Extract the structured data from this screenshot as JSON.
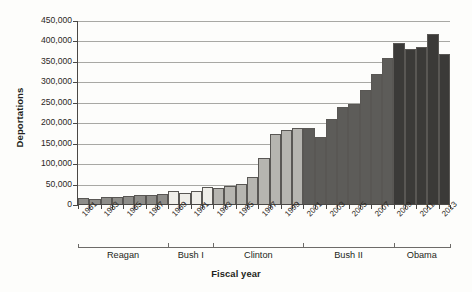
{
  "chart_data": {
    "type": "bar",
    "title": "",
    "xlabel": "Fiscal year",
    "ylabel": "Deportations",
    "ylim": [
      0,
      450000
    ],
    "ytick_labels": [
      "450,000",
      "400,000",
      "350,000",
      "300,000",
      "250,000",
      "200,000",
      "150,000",
      "100,000",
      "50,000",
      "0"
    ],
    "ytick_values": [
      450000,
      400000,
      350000,
      300000,
      250000,
      200000,
      150000,
      100000,
      50000,
      0
    ],
    "grid": true,
    "legend": "none",
    "categories": [
      1981,
      1982,
      1983,
      1984,
      1985,
      1986,
      1987,
      1988,
      1989,
      1990,
      1991,
      1992,
      1993,
      1994,
      1995,
      1996,
      1997,
      1998,
      1999,
      2000,
      2001,
      2002,
      2003,
      2004,
      2005,
      2006,
      2007,
      2008,
      2009,
      2010,
      2011,
      2012,
      2013
    ],
    "xtick_labels": [
      "1981",
      "1983",
      "1985",
      "1987",
      "1989",
      "1991",
      "1993",
      "1995",
      "1997",
      "1999",
      "2001",
      "2003",
      "2005",
      "2007",
      "2009",
      "2011",
      "2013"
    ],
    "values": [
      17379,
      15216,
      19211,
      18696,
      23105,
      24592,
      24336,
      25829,
      34427,
      30039,
      33189,
      43671,
      42542,
      45674,
      50924,
      69680,
      114432,
      174813,
      183114,
      188467,
      189026,
      165168,
      211098,
      240665,
      246431,
      280974,
      319382,
      359795,
      395165,
      382000,
      387242,
      419384,
      368644
    ],
    "series_groups": [
      {
        "name": "Reagan",
        "start_year": 1981,
        "end_year": 1988,
        "color": "#8e8d89"
      },
      {
        "name": "Bush I",
        "start_year": 1989,
        "end_year": 1992,
        "color": "#efeee9"
      },
      {
        "name": "Clinton",
        "start_year": 1993,
        "end_year": 2000,
        "color": "#b6b5b0"
      },
      {
        "name": "Bush II",
        "start_year": 2001,
        "end_year": 2008,
        "color": "#5d5c59"
      },
      {
        "name": "Obama",
        "start_year": 2009,
        "end_year": 2013,
        "color": "#3b3a38"
      }
    ],
    "bar_colors": [
      "#8e8d89",
      "#8e8d89",
      "#8e8d89",
      "#8e8d89",
      "#8e8d89",
      "#8e8d89",
      "#8e8d89",
      "#8e8d89",
      "#efeee9",
      "#efeee9",
      "#efeee9",
      "#efeee9",
      "#b6b5b0",
      "#b6b5b0",
      "#b6b5b0",
      "#b6b5b0",
      "#b6b5b0",
      "#b6b5b0",
      "#b6b5b0",
      "#b6b5b0",
      "#5d5c59",
      "#5d5c59",
      "#5d5c59",
      "#5d5c59",
      "#5d5c59",
      "#5d5c59",
      "#5d5c59",
      "#5d5c59",
      "#3b3a38",
      "#3b3a38",
      "#3b3a38",
      "#3b3a38",
      "#3b3a38"
    ]
  }
}
